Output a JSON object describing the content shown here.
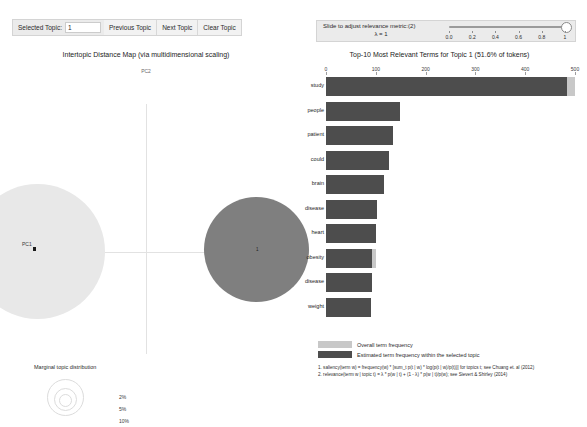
{
  "toolbar": {
    "selected_topic_label": "Selected Topic:",
    "selected_topic_value": "1",
    "previous_topic_label": "Previous Topic",
    "next_topic_label": "Next Topic",
    "clear_topic_label": "Clear Topic"
  },
  "slider": {
    "label": "Slide to adjust relevance metric:(2)",
    "lambda_text": "λ = 1",
    "value": 1,
    "min": 0,
    "max": 1,
    "ticks": [
      "0.0",
      "0.2",
      "0.4",
      "0.6",
      "0.8",
      "1"
    ]
  },
  "left_panel": {
    "title": "Intertopic Distance Map (via multidimensional scaling)",
    "axis_y_label": "PC2",
    "axis_x_label": "PC1",
    "topic_label_1": "1",
    "marginal": {
      "title": "Marginal topic distribution",
      "labels": [
        "2%",
        "5%",
        "10%"
      ]
    }
  },
  "right_panel": {
    "title": "Top-10 Most Relevant Terms for Topic 1 (51.6% of tokens)",
    "legend": {
      "overall_label": "Overall term frequency",
      "estimated_label": "Estimated term frequency within the selected topic",
      "overall_color": "#c8c8c8",
      "estimated_color": "#4d4d4d"
    },
    "footnotes": [
      "1. saliency(term w) = frequency(w) * [sum_t p(t | w) * log(p(t | w)/p(t))] for topics t; see Chuang et. al (2012)",
      "2. relevance(term w | topic t) = λ * p(w | t) + (1 - λ) * p(w | t)/p(w); see Sievert & Shirley (2014)"
    ]
  },
  "chart_data": {
    "type": "bar",
    "title": "Top-10 Most Relevant Terms for Topic 1 (51.6% of tokens)",
    "orientation": "horizontal",
    "xlabel": "",
    "ylabel": "",
    "xlim": [
      0,
      500
    ],
    "xticks": [
      0,
      100,
      200,
      300,
      400,
      500
    ],
    "grid": false,
    "legend_position": "bottom-left",
    "categories": [
      "study",
      "people",
      "patient",
      "could",
      "brain",
      "disease",
      "heart",
      "obesity",
      "disease",
      "weight"
    ],
    "series": [
      {
        "name": "Overall term frequency",
        "color": "#c8c8c8",
        "values": [
          500,
          149,
          135,
          126,
          117,
          103,
          100,
          100,
          92,
          90
        ]
      },
      {
        "name": "Estimated term frequency within the selected topic",
        "color": "#4d4d4d",
        "values": [
          484,
          149,
          135,
          126,
          117,
          103,
          100,
          92,
          92,
          90
        ]
      }
    ]
  }
}
